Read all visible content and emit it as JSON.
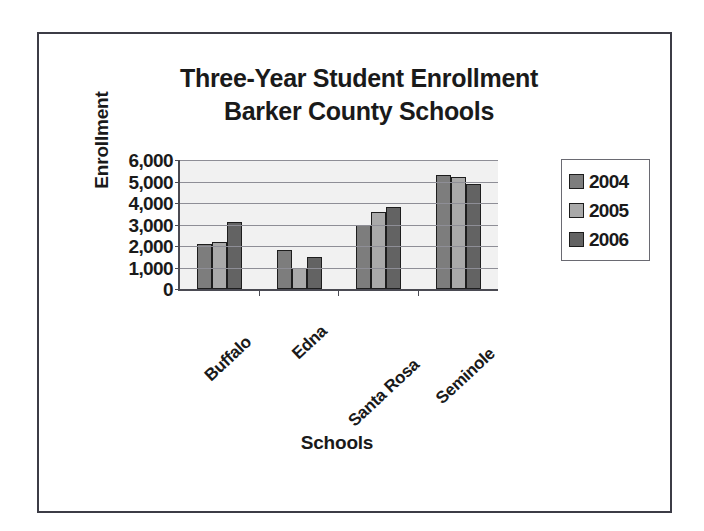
{
  "chart_data": {
    "type": "bar",
    "title": "Three-Year Student Enrollment Barker County Schools",
    "title_line1": "Three-Year Student Enrollment",
    "title_line2": "Barker County Schools",
    "xlabel": "Schools",
    "ylabel": "Enrollment",
    "categories": [
      "Buffalo",
      "Edna",
      "Santa Rosa",
      "Seminole"
    ],
    "series": [
      {
        "name": "2004",
        "color": "#7d7d7d",
        "values": [
          2100,
          1800,
          3000,
          5300
        ]
      },
      {
        "name": "2005",
        "color": "#a9a9a9",
        "values": [
          2200,
          1000,
          3600,
          5200
        ]
      },
      {
        "name": "2006",
        "color": "#636363",
        "values": [
          3100,
          1500,
          3800,
          4900
        ]
      }
    ],
    "ylim": [
      0,
      6000
    ],
    "ytick_values": [
      6000,
      5000,
      4000,
      3000,
      2000,
      1000,
      0
    ],
    "ytick_labels": [
      "6,000",
      "5,000",
      "4,000",
      "3,000",
      "2,000",
      "1,000",
      "0"
    ],
    "grid": true,
    "grid_axis": "y",
    "legend_position": "right",
    "plot_background": "#f1f1f1",
    "axis_color": "#4a4a52",
    "category_label_rotation": -43
  }
}
